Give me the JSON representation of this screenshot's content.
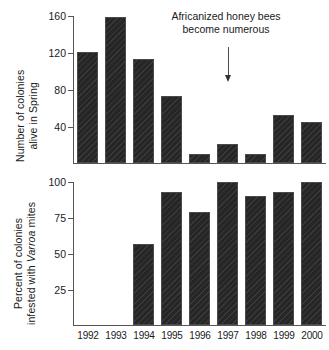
{
  "chart_data": [
    {
      "type": "bar",
      "panel": "top",
      "title": "",
      "xlabel": "",
      "ylabel": "Number of colonies alive in Spring",
      "ylabel_line1": "Number of colonies",
      "ylabel_line2": "alive in Spring",
      "categories": [
        "1992",
        "1993",
        "1994",
        "1995",
        "1996",
        "1997",
        "1998",
        "1999",
        "2000"
      ],
      "values": [
        121,
        159,
        113,
        73,
        10,
        21,
        10,
        52,
        45
      ],
      "yticks": [
        40,
        80,
        120,
        160
      ],
      "ylim": [
        0,
        160
      ],
      "grid": false,
      "legend": "none",
      "annotations": [
        {
          "text_line1": "Africanized honey bees",
          "text_line2": "become numerous",
          "marker": "down-arrow",
          "points_to": "1997"
        }
      ]
    },
    {
      "type": "bar",
      "panel": "bottom",
      "title": "",
      "xlabel": "",
      "ylabel": "Percent of colonies infested with Varroa mites",
      "ylabel_line1": "Percent of colonies",
      "ylabel_line2_pre": "infested with ",
      "ylabel_line2_em": "Varroa",
      "ylabel_line2_post": " mites",
      "categories": [
        "1992",
        "1993",
        "1994",
        "1995",
        "1996",
        "1997",
        "1998",
        "1999",
        "2000"
      ],
      "values": [
        null,
        null,
        57,
        93,
        79,
        100,
        90,
        93,
        100
      ],
      "yticks": [
        25,
        50,
        75,
        100
      ],
      "ylim": [
        0,
        100
      ],
      "grid": false,
      "legend": "none"
    }
  ],
  "colors": {
    "bar_fill": "#262626",
    "bar_edge": "#4a4a4a",
    "axis": "#555555",
    "text": "#1a1a1a",
    "background": "#ffffff"
  },
  "axes": {
    "top": {
      "tick_labels": [
        "160",
        "120",
        "80",
        "40"
      ]
    },
    "bottom": {
      "tick_labels": [
        "100",
        "75",
        "50",
        "25"
      ]
    },
    "x_tick_labels": [
      "1992",
      "1993",
      "1994",
      "1995",
      "1996",
      "1997",
      "1998",
      "1999",
      "2000"
    ]
  }
}
